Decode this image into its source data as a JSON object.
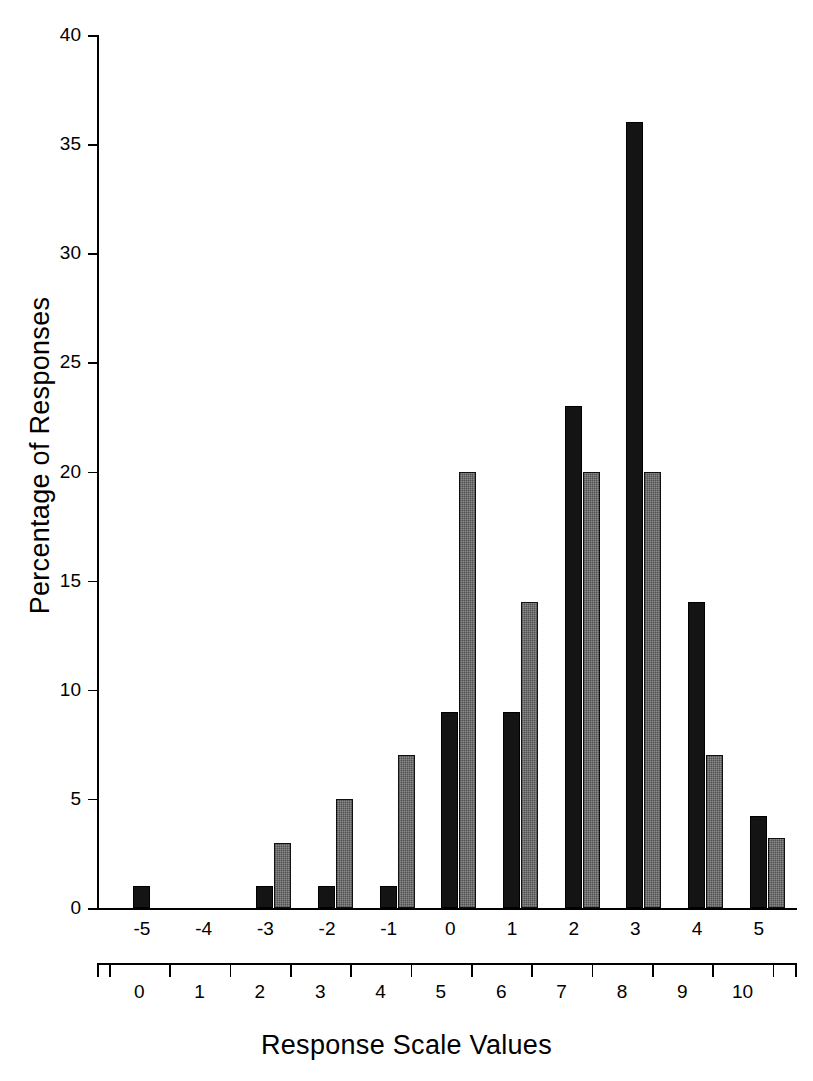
{
  "chart_data": {
    "type": "bar",
    "title": "",
    "xlabel": "Response Scale Values",
    "ylabel": "Percentage of Responses",
    "ylim": [
      0,
      40
    ],
    "ytick_values": [
      0,
      5,
      10,
      15,
      20,
      25,
      30,
      35,
      40
    ],
    "ytick_labels": [
      "0",
      "5",
      "10",
      "15",
      "20",
      "25",
      "30",
      "35",
      "40"
    ],
    "grid": false,
    "legend": "none",
    "categories": [
      "-5",
      "-4",
      "-3",
      "-2",
      "-1",
      "0",
      "1",
      "2",
      "3",
      "4",
      "5"
    ],
    "secondary_axis": {
      "label": "Response Scale Values",
      "tick_labels": [
        "0",
        "1",
        "2",
        "3",
        "4",
        "5",
        "6",
        "7",
        "8",
        "9",
        "10"
      ]
    },
    "series": [
      {
        "name": "black",
        "color": "#141414",
        "values": [
          1,
          0,
          1,
          1,
          1,
          9,
          9,
          23,
          36,
          14,
          4.2
        ]
      },
      {
        "name": "gray",
        "color": "#8a8a8a",
        "values": [
          0,
          0,
          3,
          5,
          7,
          20,
          14,
          20,
          20,
          7,
          3.2
        ]
      }
    ]
  },
  "axis": {
    "y_label": "Percentage of Responses",
    "x_label": "Response Scale Values"
  }
}
